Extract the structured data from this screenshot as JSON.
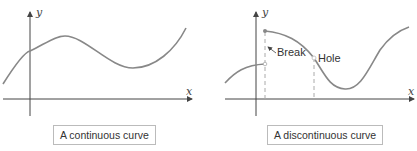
{
  "figures": [
    {
      "id": "continuous",
      "caption": "A continuous curve",
      "axis_x_label": "x",
      "axis_y_label": "y"
    },
    {
      "id": "discontinuous",
      "caption": "A discontinuous curve",
      "axis_x_label": "x",
      "axis_y_label": "y",
      "annotations": {
        "break": "Break",
        "hole": "Hole"
      }
    }
  ],
  "colors": {
    "curve": "#888888",
    "axis": "#444444",
    "dashed": "#aaaaaa"
  }
}
